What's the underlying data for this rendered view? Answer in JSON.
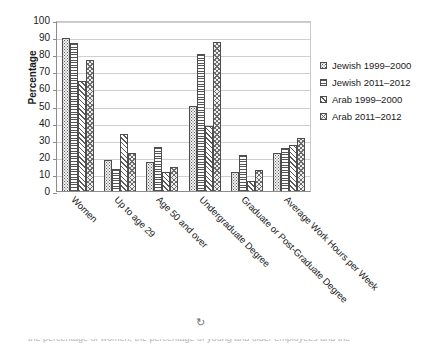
{
  "chart_data": {
    "type": "bar",
    "title": "",
    "xlabel": "",
    "ylabel": "Percentage",
    "ylim": [
      0,
      100
    ],
    "ytick_step": 10,
    "yticks": [
      100,
      90,
      80,
      70,
      60,
      50,
      40,
      30,
      20,
      10,
      0
    ],
    "grid": true,
    "legend_position": "right",
    "categories": [
      "Women",
      "Up to age 29",
      "Age 50 and over",
      "Undergraduate Degree",
      "Graduate or Post-Graduate Degree",
      "Average Work Hours per Week"
    ],
    "series": [
      {
        "name": "Jewish 1999–2000",
        "pattern": "dots",
        "values": [
          89.5,
          18,
          17,
          50,
          11,
          22
        ]
      },
      {
        "name": "Jewish 2011–2012",
        "pattern": "horizontal-lines",
        "values": [
          86.5,
          13,
          26,
          80,
          21,
          25
        ]
      },
      {
        "name": "Arab 1999–2000",
        "pattern": "diagonal-hatch",
        "values": [
          64.5,
          33.5,
          11,
          38,
          6,
          27
        ]
      },
      {
        "name": "Arab 2011–2012",
        "pattern": "checkered",
        "values": [
          76.5,
          22,
          14,
          87,
          12,
          31
        ]
      }
    ]
  },
  "legend": {
    "items": [
      {
        "label": "Jewish 1999–2000",
        "pattern": "dots"
      },
      {
        "label": "Jewish 2011–2012",
        "pattern": "horizontal-lines"
      },
      {
        "label": "Arab 1999–2000",
        "pattern": "diagonal-hatch"
      },
      {
        "label": "Arab 2011–2012",
        "pattern": "checkered"
      }
    ]
  },
  "footer": {
    "clipped_caption": "the percentage of women, the percentage of young and older employees and the"
  },
  "colors": {
    "axis": "#8c8c8c",
    "grid": "#cfcfcf",
    "text": "#1a1a1a",
    "bar_outline": "#4d4d4d",
    "background": "#ffffff"
  }
}
